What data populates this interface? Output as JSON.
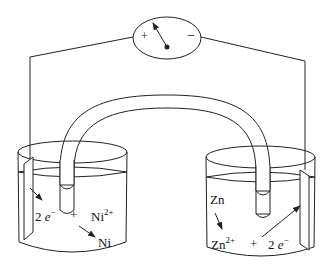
{
  "diagram": {
    "type": "galvanic-cell",
    "meter": {
      "plus_label": "+",
      "minus_label": "−"
    },
    "left_cell": {
      "electrons": "2",
      "electron_symbol": "e",
      "electron_charge": "−",
      "plus": "+",
      "ion": "Ni",
      "ion_charge": "2+",
      "product": "Ni"
    },
    "right_cell": {
      "metal": "Zn",
      "ion": "Zn",
      "ion_charge": "2+",
      "plus": "+",
      "electrons": "2",
      "electron_symbol": "e",
      "electron_charge": "−"
    },
    "colors": {
      "line": "#222222",
      "background": "#ffffff"
    }
  }
}
